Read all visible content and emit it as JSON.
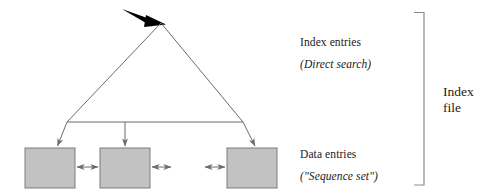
{
  "figure": {
    "width": 487,
    "height": 193,
    "background": "#ffffff"
  },
  "labels": {
    "index_entries": "Index entries",
    "direct_search": "(Direct search)",
    "data_entries": "Data entries",
    "sequence_set": "(\"Sequence set\")",
    "index_file_line1": "Index",
    "index_file_line2": "file"
  },
  "colors": {
    "stroke": "#6b6b6b",
    "arrow_black": "#000000",
    "box_fill": "#c2c2c2",
    "box_stroke": "#7d7d7d",
    "bracket": "#8a8a8a",
    "text": "#1a1a1a"
  },
  "shapes": {
    "triangle": {
      "name": "index-triangle",
      "apex_x": 161,
      "apex_y": 23,
      "left_x": 67,
      "right_x": 243,
      "base_y": 122
    },
    "entry_arrow": {
      "name": "entry-search-arrow",
      "from_x": 122,
      "from_y": 9,
      "to_x": 163,
      "to_y": 24
    },
    "boxes": [
      {
        "name": "data-entry-box-1",
        "x": 25,
        "y": 148,
        "w": 50,
        "h": 40
      },
      {
        "name": "data-entry-box-2",
        "x": 100,
        "y": 148,
        "w": 50,
        "h": 40
      },
      {
        "name": "data-entry-box-3",
        "x": 227,
        "y": 148,
        "w": 50,
        "h": 40
      }
    ],
    "down_arrows": [
      {
        "name": "leaf-pointer-arrow-left",
        "x1": 67,
        "y1": 122,
        "x2": 57,
        "y2": 147
      },
      {
        "name": "leaf-pointer-arrow-middle",
        "x1": 125,
        "y1": 122,
        "x2": 125,
        "y2": 147
      },
      {
        "name": "leaf-pointer-arrow-right",
        "x1": 243,
        "y1": 122,
        "x2": 256,
        "y2": 147
      }
    ],
    "sibling_arrows": [
      {
        "name": "sibling-link-arrow-1-2",
        "x1": 76,
        "x2": 99,
        "y": 167
      },
      {
        "name": "sibling-link-arrow-2-right",
        "x1": 151,
        "x2": 172,
        "y": 167
      },
      {
        "name": "sibling-link-arrow-left-3",
        "x1": 204,
        "x2": 226,
        "y": 167
      }
    ],
    "bracket": {
      "name": "index-file-bracket",
      "x": 424,
      "top_y": 12,
      "bottom_y": 185,
      "tick_len": 10
    }
  }
}
